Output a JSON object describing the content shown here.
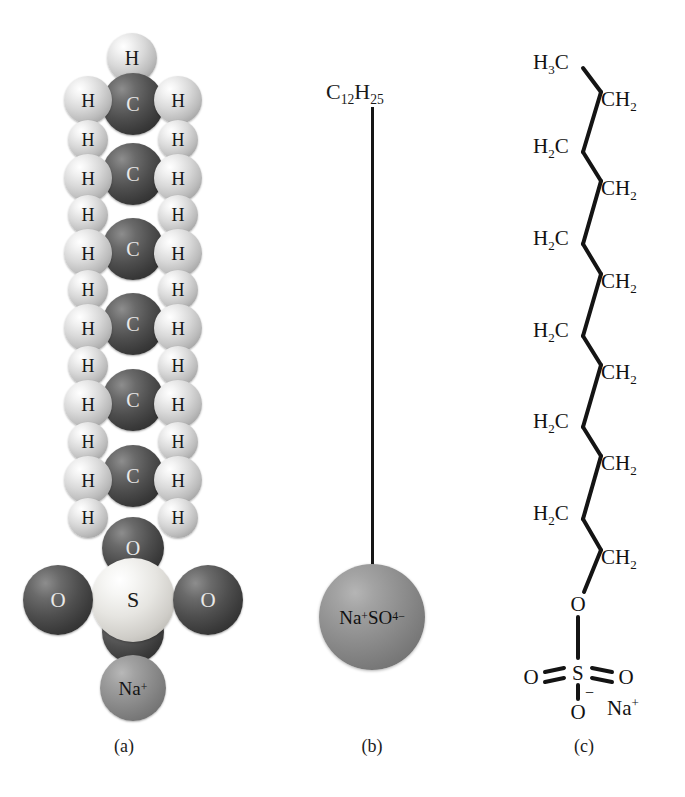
{
  "figure": {
    "background_color": "#ffffff",
    "ink_color": "#161616"
  },
  "captions": [
    {
      "id": "a",
      "label": "(a)",
      "x": 124,
      "y": 744
    },
    {
      "id": "b",
      "label": "(b)",
      "x": 372,
      "y": 744
    },
    {
      "id": "c",
      "label": "(c)",
      "x": 584,
      "y": 744
    }
  ],
  "panel_a": {
    "name": "space-filling-model",
    "colors": {
      "carbon": "#3a3a3a",
      "hydrogen": "#d9d9d9",
      "oxygen": "#3a3a3a",
      "sulfur": "#e6e5e1",
      "sodium": "#8d8d8d"
    },
    "atoms": [
      {
        "element": "H",
        "label": "H",
        "kind": "light",
        "cx": 132,
        "cy": 58,
        "r": 25,
        "font": 20,
        "z": 1
      },
      {
        "element": "H",
        "label": "H",
        "kind": "light",
        "cx": 88,
        "cy": 100,
        "r": 24,
        "font": 19,
        "z": 3
      },
      {
        "element": "C",
        "label": "C",
        "kind": "dark",
        "cx": 133,
        "cy": 104,
        "r": 31,
        "font": 20,
        "z": 2
      },
      {
        "element": "H",
        "label": "H",
        "kind": "light",
        "cx": 178,
        "cy": 100,
        "r": 24,
        "font": 19,
        "z": 3
      },
      {
        "element": "H",
        "label": "H",
        "kind": "light",
        "cx": 88,
        "cy": 140,
        "r": 20,
        "font": 18,
        "z": 3
      },
      {
        "element": "H",
        "label": "H",
        "kind": "light",
        "cx": 178,
        "cy": 140,
        "r": 20,
        "font": 18,
        "z": 3
      },
      {
        "element": "H",
        "label": "H",
        "kind": "light",
        "cx": 88,
        "cy": 178,
        "r": 24,
        "font": 19,
        "z": 3
      },
      {
        "element": "C",
        "label": "C",
        "kind": "dark",
        "cx": 133,
        "cy": 174,
        "r": 31,
        "font": 20,
        "z": 2
      },
      {
        "element": "H",
        "label": "H",
        "kind": "light",
        "cx": 178,
        "cy": 178,
        "r": 24,
        "font": 19,
        "z": 3
      },
      {
        "element": "H",
        "label": "H",
        "kind": "light",
        "cx": 88,
        "cy": 215,
        "r": 20,
        "font": 18,
        "z": 3
      },
      {
        "element": "H",
        "label": "H",
        "kind": "light",
        "cx": 178,
        "cy": 215,
        "r": 20,
        "font": 18,
        "z": 3
      },
      {
        "element": "H",
        "label": "H",
        "kind": "light",
        "cx": 88,
        "cy": 253,
        "r": 24,
        "font": 19,
        "z": 3
      },
      {
        "element": "C",
        "label": "C",
        "kind": "dark",
        "cx": 133,
        "cy": 249,
        "r": 31,
        "font": 20,
        "z": 2
      },
      {
        "element": "H",
        "label": "H",
        "kind": "light",
        "cx": 178,
        "cy": 253,
        "r": 24,
        "font": 19,
        "z": 3
      },
      {
        "element": "H",
        "label": "H",
        "kind": "light",
        "cx": 88,
        "cy": 290,
        "r": 20,
        "font": 18,
        "z": 3
      },
      {
        "element": "H",
        "label": "H",
        "kind": "light",
        "cx": 178,
        "cy": 290,
        "r": 20,
        "font": 18,
        "z": 3
      },
      {
        "element": "H",
        "label": "H",
        "kind": "light",
        "cx": 88,
        "cy": 328,
        "r": 24,
        "font": 19,
        "z": 3
      },
      {
        "element": "C",
        "label": "C",
        "kind": "dark",
        "cx": 133,
        "cy": 324,
        "r": 31,
        "font": 20,
        "z": 2
      },
      {
        "element": "H",
        "label": "H",
        "kind": "light",
        "cx": 178,
        "cy": 328,
        "r": 24,
        "font": 19,
        "z": 3
      },
      {
        "element": "H",
        "label": "H",
        "kind": "light",
        "cx": 88,
        "cy": 366,
        "r": 20,
        "font": 18,
        "z": 3
      },
      {
        "element": "H",
        "label": "H",
        "kind": "light",
        "cx": 178,
        "cy": 366,
        "r": 20,
        "font": 18,
        "z": 3
      },
      {
        "element": "H",
        "label": "H",
        "kind": "light",
        "cx": 88,
        "cy": 404,
        "r": 24,
        "font": 19,
        "z": 3
      },
      {
        "element": "C",
        "label": "C",
        "kind": "dark",
        "cx": 133,
        "cy": 400,
        "r": 31,
        "font": 20,
        "z": 2
      },
      {
        "element": "H",
        "label": "H",
        "kind": "light",
        "cx": 178,
        "cy": 404,
        "r": 24,
        "font": 19,
        "z": 3
      },
      {
        "element": "H",
        "label": "H",
        "kind": "light",
        "cx": 88,
        "cy": 442,
        "r": 20,
        "font": 18,
        "z": 3
      },
      {
        "element": "H",
        "label": "H",
        "kind": "light",
        "cx": 178,
        "cy": 442,
        "r": 20,
        "font": 18,
        "z": 3
      },
      {
        "element": "H",
        "label": "H",
        "kind": "light",
        "cx": 88,
        "cy": 480,
        "r": 24,
        "font": 19,
        "z": 3
      },
      {
        "element": "C",
        "label": "C",
        "kind": "dark",
        "cx": 133,
        "cy": 476,
        "r": 31,
        "font": 20,
        "z": 2
      },
      {
        "element": "H",
        "label": "H",
        "kind": "light",
        "cx": 178,
        "cy": 480,
        "r": 24,
        "font": 19,
        "z": 3
      },
      {
        "element": "H",
        "label": "H",
        "kind": "light",
        "cx": 88,
        "cy": 518,
        "r": 20,
        "font": 18,
        "z": 3
      },
      {
        "element": "H",
        "label": "H",
        "kind": "light",
        "cx": 178,
        "cy": 518,
        "r": 20,
        "font": 18,
        "z": 3
      },
      {
        "element": "O",
        "label": "O",
        "kind": "dark",
        "cx": 133,
        "cy": 548,
        "r": 31,
        "font": 20,
        "z": 2
      },
      {
        "element": "O",
        "label": "O",
        "kind": "dark",
        "cx": 58,
        "cy": 600,
        "r": 35,
        "font": 21,
        "z": 3
      },
      {
        "element": "O",
        "label": "O",
        "kind": "dark",
        "cx": 208,
        "cy": 600,
        "r": 35,
        "font": 21,
        "z": 3
      },
      {
        "element": "S",
        "label": "S",
        "kind": "pale",
        "cx": 133,
        "cy": 600,
        "r": 42,
        "font": 22,
        "z": 2
      },
      {
        "element": "O",
        "label": "O",
        "kind": "dark",
        "cx": 133,
        "cy": 632,
        "r": 31,
        "font": 20,
        "z": 1
      },
      {
        "element": "Na",
        "label": "Na",
        "charge": "+",
        "kind": "med",
        "cx": 133,
        "cy": 688,
        "r": 33,
        "font": 19,
        "z": 4
      }
    ]
  },
  "panel_b": {
    "name": "simplified-surfactant-model",
    "tail_label": {
      "text": "C",
      "sub1": "12",
      "text2": "H",
      "sub2": "25",
      "x": 372,
      "y": 95
    },
    "tail_line": {
      "x": 372,
      "y_top": 107,
      "y_bottom": 566,
      "width": 3,
      "color": "#161616"
    },
    "head": {
      "label_text": "Na",
      "label_sup1": "+",
      "label_text2": "SO",
      "label_sub": "4",
      "label_sup2": "−",
      "cx": 372,
      "cy": 617,
      "r": 53,
      "font": 19,
      "color": "#8f8f8f"
    }
  },
  "panel_c": {
    "name": "skeletal-formula",
    "bond_color": "#141414",
    "bond_width": 4,
    "vertices": [
      {
        "id": "c1",
        "label": "H3C",
        "side": "left",
        "x": 551,
        "y": 62,
        "anchor_x": 583,
        "anchor_y": 68
      },
      {
        "id": "c2",
        "label": "CH2",
        "side": "right",
        "x": 619,
        "y": 99,
        "anchor_x": 601,
        "anchor_y": 92
      },
      {
        "id": "c3",
        "label": "H2C",
        "side": "left",
        "x": 551,
        "y": 146,
        "anchor_x": 583,
        "anchor_y": 152
      },
      {
        "id": "c4",
        "label": "CH2",
        "side": "right",
        "x": 619,
        "y": 188,
        "anchor_x": 601,
        "anchor_y": 181
      },
      {
        "id": "c5",
        "label": "H2C",
        "side": "left",
        "x": 551,
        "y": 238,
        "anchor_x": 583,
        "anchor_y": 244
      },
      {
        "id": "c6",
        "label": "CH2",
        "side": "right",
        "x": 619,
        "y": 281,
        "anchor_x": 601,
        "anchor_y": 274
      },
      {
        "id": "c7",
        "label": "H2C",
        "side": "left",
        "x": 551,
        "y": 330,
        "anchor_x": 583,
        "anchor_y": 336
      },
      {
        "id": "c8",
        "label": "CH2",
        "side": "right",
        "x": 619,
        "y": 372,
        "anchor_x": 601,
        "anchor_y": 365
      },
      {
        "id": "c9",
        "label": "H2C",
        "side": "left",
        "x": 551,
        "y": 421,
        "anchor_x": 583,
        "anchor_y": 427
      },
      {
        "id": "c10",
        "label": "CH2",
        "side": "right",
        "x": 619,
        "y": 463,
        "anchor_x": 601,
        "anchor_y": 456
      },
      {
        "id": "c11",
        "label": "H2C",
        "side": "left",
        "x": 551,
        "y": 513,
        "anchor_x": 583,
        "anchor_y": 519
      },
      {
        "id": "c12",
        "label": "CH2",
        "side": "right",
        "x": 619,
        "y": 557,
        "anchor_x": 601,
        "anchor_y": 550
      }
    ],
    "head_group": {
      "ester_oxygen": {
        "label": "O",
        "x": 578,
        "y": 604
      },
      "sulfur": {
        "label": "S",
        "x": 578,
        "y": 673
      },
      "oxygen_left": {
        "label": "O",
        "x": 531,
        "y": 677
      },
      "oxygen_right": {
        "label": "O",
        "x": 626,
        "y": 677
      },
      "oxygen_bottom": {
        "label": "O",
        "x": 578,
        "y": 712,
        "charge": "−"
      },
      "sodium": {
        "label": "Na",
        "charge": "+",
        "x": 623,
        "y": 708
      }
    },
    "formula_note": {
      "carbon_count": 12,
      "methyl_terminus": "H3C",
      "repeat_unit": "CH2"
    }
  }
}
